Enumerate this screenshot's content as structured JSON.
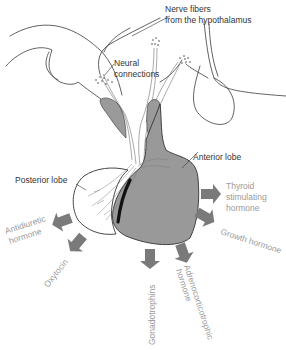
{
  "diagram": {
    "colors": {
      "anterior_lobe": "#999999",
      "posterior_lobe": "#ffffff",
      "arrow": "#7a7a7a",
      "outline": "#333333",
      "label_dark": "#333333",
      "label_light": "#9a9a9a"
    },
    "structure_labels": {
      "nerve_fibers_line1": "Nerve fibers",
      "nerve_fibers_line2": "from the hypothalamus",
      "neural_line1": "Neural",
      "neural_line2": "connections",
      "anterior_lobe": "Anterior lobe",
      "posterior_lobe": "Posterior lobe"
    },
    "hormone_outputs": [
      {
        "id": "tsh",
        "line1": "Thyroid",
        "line2": "stimulating",
        "line3": "hormone",
        "source": "anterior lobe"
      },
      {
        "id": "gh",
        "line1": "Growth hormone",
        "source": "anterior lobe"
      },
      {
        "id": "acth",
        "line1": "Adrenocorticotrophic",
        "line2": "hormone",
        "source": "anterior lobe"
      },
      {
        "id": "gonadotrophins",
        "line1": "Gonadotrophins",
        "source": "anterior lobe"
      },
      {
        "id": "oxytocin",
        "line1": "Oxytocin",
        "source": "posterior lobe"
      },
      {
        "id": "adh",
        "line1": "Antidiuretic",
        "line2": "hormone",
        "source": "posterior lobe"
      }
    ]
  }
}
